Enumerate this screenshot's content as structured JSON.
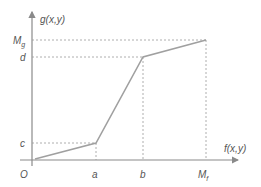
{
  "diagram": {
    "y_axis_label": "g(x,y)",
    "x_axis_label": "f(x,y)",
    "origin_label": "O",
    "x_ticks": [
      {
        "label": "a",
        "sub": ""
      },
      {
        "label": "b",
        "sub": ""
      },
      {
        "label": "M",
        "sub": "f"
      }
    ],
    "y_ticks": [
      {
        "label": "c",
        "sub": ""
      },
      {
        "label": "d",
        "sub": ""
      },
      {
        "label": "M",
        "sub": "g"
      }
    ],
    "colors": {
      "axis": "#8a8a8a",
      "curve": "#a0a0a0",
      "guide": "#9a9a9a",
      "text": "#555555"
    },
    "piecewise_points": [
      {
        "x": "0",
        "y": "0"
      },
      {
        "x": "a",
        "y": "c"
      },
      {
        "x": "b",
        "y": "d"
      },
      {
        "x": "M_f",
        "y": "M_g"
      }
    ]
  }
}
